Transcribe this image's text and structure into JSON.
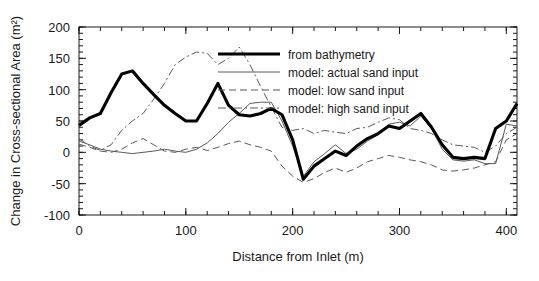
{
  "chart_data": {
    "type": "line",
    "title": "",
    "xlabel": "Distance from Inlet (m)",
    "ylabel": "Change in Cross-sectional Area (m²)",
    "xlim": [
      0,
      410
    ],
    "ylim": [
      -100,
      200
    ],
    "xticks": [
      0,
      100,
      200,
      300,
      400
    ],
    "yticks": [
      -100,
      -50,
      0,
      50,
      100,
      150,
      200
    ],
    "xtick_labels": [
      "0",
      "100",
      "200",
      "300",
      "400"
    ],
    "ytick_labels": [
      "-100",
      "-50",
      "0",
      "50",
      "100",
      "150",
      "200"
    ],
    "minor_tick_interval_x": 20,
    "minor_tick_interval_y": 10,
    "grid": false,
    "legend_position": "upper right",
    "series": [
      {
        "name": "from bathymetry",
        "style": "solid-bold",
        "color": "#000000",
        "x": [
          0,
          10,
          20,
          30,
          40,
          50,
          60,
          70,
          80,
          90,
          100,
          110,
          120,
          130,
          140,
          150,
          160,
          170,
          180,
          190,
          200,
          210,
          220,
          230,
          240,
          250,
          260,
          270,
          280,
          290,
          300,
          310,
          320,
          330,
          340,
          350,
          360,
          370,
          380,
          390,
          400,
          410
        ],
        "y": [
          43,
          55,
          62,
          95,
          125,
          130,
          110,
          92,
          75,
          62,
          50,
          50,
          78,
          110,
          75,
          60,
          58,
          62,
          70,
          60,
          20,
          -43,
          -22,
          -10,
          2,
          -5,
          10,
          22,
          30,
          42,
          38,
          50,
          62,
          40,
          12,
          -8,
          -10,
          -8,
          -10,
          38,
          50,
          78
        ]
      },
      {
        "name": "model: actual sand input",
        "style": "solid-thin",
        "color": "#5a5a5a",
        "x": [
          0,
          10,
          20,
          30,
          40,
          50,
          60,
          70,
          80,
          90,
          100,
          110,
          120,
          130,
          140,
          150,
          160,
          170,
          180,
          190,
          200,
          210,
          220,
          230,
          240,
          250,
          260,
          270,
          280,
          290,
          300,
          310,
          320,
          330,
          340,
          350,
          360,
          370,
          380,
          390,
          400,
          410
        ],
        "y": [
          18,
          12,
          5,
          2,
          0,
          -2,
          0,
          2,
          5,
          2,
          0,
          5,
          15,
          30,
          48,
          62,
          78,
          80,
          80,
          50,
          10,
          -38,
          -15,
          -2,
          12,
          -2,
          5,
          18,
          28,
          45,
          48,
          42,
          58,
          38,
          5,
          -12,
          -14,
          -12,
          -18,
          -18,
          45,
          42
        ]
      },
      {
        "name": "model: low sand input",
        "style": "dashed",
        "color": "#5a5a5a",
        "x": [
          0,
          10,
          20,
          30,
          40,
          50,
          60,
          70,
          80,
          90,
          100,
          110,
          120,
          130,
          140,
          150,
          160,
          170,
          180,
          190,
          200,
          210,
          220,
          230,
          240,
          250,
          260,
          270,
          280,
          290,
          300,
          310,
          320,
          330,
          340,
          350,
          360,
          370,
          380,
          390,
          400,
          410
        ],
        "y": [
          13,
          8,
          2,
          0,
          5,
          15,
          22,
          12,
          2,
          0,
          5,
          8,
          3,
          8,
          14,
          18,
          12,
          8,
          2,
          -22,
          -38,
          -48,
          -42,
          -32,
          -25,
          -32,
          -25,
          -15,
          -10,
          -5,
          -8,
          -12,
          -15,
          -20,
          -28,
          -30,
          -28,
          -25,
          -20,
          -15,
          20,
          30
        ]
      },
      {
        "name": "model: high sand input",
        "style": "dash-dot",
        "color": "#5a5a5a",
        "x": [
          0,
          10,
          20,
          30,
          40,
          50,
          60,
          70,
          80,
          90,
          100,
          110,
          120,
          130,
          140,
          150,
          160,
          170,
          180,
          190,
          200,
          210,
          220,
          230,
          240,
          250,
          260,
          270,
          280,
          290,
          300,
          310,
          320,
          330,
          340,
          350,
          360,
          370,
          380,
          390,
          400,
          410
        ],
        "y": [
          22,
          10,
          3,
          12,
          35,
          50,
          62,
          85,
          110,
          140,
          152,
          160,
          158,
          140,
          150,
          168,
          140,
          105,
          72,
          40,
          35,
          38,
          30,
          35,
          32,
          30,
          38,
          40,
          48,
          55,
          52,
          38,
          35,
          30,
          20,
          12,
          10,
          8,
          0,
          10,
          30,
          40
        ]
      }
    ]
  },
  "legend": {
    "entries": [
      {
        "label": "from bathymetry"
      },
      {
        "label": "model: actual sand input"
      },
      {
        "label": "model: low sand input"
      },
      {
        "label": "model: high sand input"
      }
    ]
  }
}
